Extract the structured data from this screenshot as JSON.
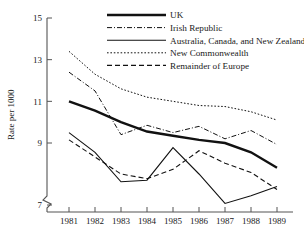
{
  "chart_data": {
    "type": "line",
    "title": "",
    "xlabel": "",
    "ylabel": "Rate per 1000",
    "x": [
      1981,
      1982,
      1983,
      1984,
      1985,
      1986,
      1987,
      1988,
      1989
    ],
    "categories": [
      "1981",
      "1982",
      "1983",
      "1984",
      "1985",
      "1986",
      "1987",
      "1988",
      "1989"
    ],
    "xticklabels": [
      "1981",
      "1982",
      "1983",
      "1984",
      "1985",
      "1986",
      "1987",
      "1988",
      "1989"
    ],
    "yticklabels": [
      "15",
      "13",
      "11",
      "9",
      "7"
    ],
    "yticks": [
      15,
      13,
      11,
      9,
      7
    ],
    "ylim": [
      7,
      15
    ],
    "xlim": [
      1981,
      1989
    ],
    "y_axis_break": true,
    "grid": false,
    "legend_position": "top-right",
    "series": [
      {
        "name": "UK",
        "style": "thick-solid",
        "values": [
          11.0,
          10.55,
          10.0,
          9.55,
          9.35,
          9.15,
          9.0,
          8.7,
          8.2
        ]
      },
      {
        "name": "Irish Republic",
        "style": "dash-dot",
        "values": [
          12.4,
          11.5,
          9.4,
          9.85,
          9.5,
          9.8,
          9.2,
          9.6,
          8.95
        ]
      },
      {
        "name": "Australia, Canada, and New Zealand,",
        "style": "thin-solid",
        "values": [
          9.5,
          8.7,
          7.75,
          7.8,
          8.85,
          8.0,
          7.05,
          7.3,
          7.6
        ]
      },
      {
        "name": "New Commonwealth",
        "style": "dotted",
        "values": [
          13.4,
          12.3,
          11.6,
          11.2,
          11.0,
          10.8,
          10.75,
          10.5,
          10.1
        ]
      },
      {
        "name": "Remainder of Europe",
        "style": "dashed",
        "values": [
          9.15,
          8.55,
          8.0,
          7.85,
          8.15,
          8.75,
          8.35,
          8.05,
          7.5
        ]
      }
    ]
  },
  "legend": {
    "items": [
      {
        "label": "UK"
      },
      {
        "label": "Irish Republic"
      },
      {
        "label": "Australia, Canada, and New Zealand,"
      },
      {
        "label": "New Commonwealth"
      },
      {
        "label": "Remainder of Europe"
      }
    ]
  },
  "axes": {
    "y_title": "Rate per 1000",
    "y_ticks": [
      "15",
      "13",
      "11",
      "9",
      "7"
    ],
    "x_ticks": [
      "1981",
      "1982",
      "1983",
      "1984",
      "1985",
      "1986",
      "1987",
      "1988",
      "1989"
    ]
  }
}
